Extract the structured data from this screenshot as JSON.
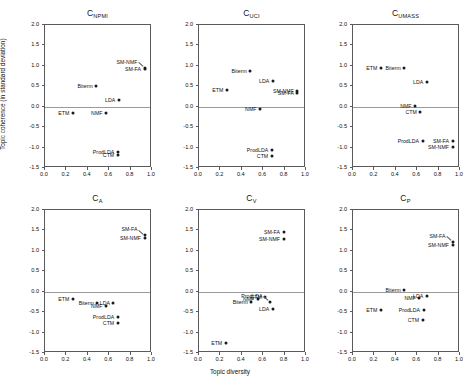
{
  "figure": {
    "ylabel": "Topic coherence (in standard deviation)",
    "xlabel": "Topic diversity",
    "xticks": [
      "0.0",
      "0.2",
      "0.4",
      "0.6",
      "0.8",
      "1.0"
    ],
    "yticks": [
      "2.0",
      "1.5",
      "1.0",
      "0.5",
      "0.0",
      "-0.5",
      "-1.0",
      "-1.5"
    ],
    "point_color": "#1a1a1a",
    "axis_color": "#5a5a5a"
  },
  "chart_data": [
    {
      "type": "scatter",
      "title": "C_NPMI",
      "title_base": "C",
      "title_sub": "NPMI",
      "xlabel": "",
      "ylabel": "Topic coherence (in standard deviation)",
      "xlim": [
        0.0,
        1.0
      ],
      "ylim": [
        -1.5,
        2.0
      ],
      "grid": false,
      "legend": "none",
      "points": [
        {
          "label": "SM-NMF",
          "x": 0.93,
          "y": 0.95,
          "label_pos": "leader-left"
        },
        {
          "label": "SM-FA",
          "x": 0.93,
          "y": 0.92,
          "label_pos": "left"
        },
        {
          "label": "Biterm",
          "x": 0.48,
          "y": 0.5,
          "label_pos": "left"
        },
        {
          "label": "LDA",
          "x": 0.69,
          "y": 0.17,
          "label_pos": "left"
        },
        {
          "label": "ETM",
          "x": 0.26,
          "y": -0.15,
          "label_pos": "left"
        },
        {
          "label": "NMF",
          "x": 0.57,
          "y": -0.15,
          "label_pos": "left"
        },
        {
          "label": "ProdLDA",
          "x": 0.68,
          "y": -1.1,
          "label_pos": "left"
        },
        {
          "label": "CTM",
          "x": 0.68,
          "y": -1.17,
          "label_pos": "left"
        }
      ]
    },
    {
      "type": "scatter",
      "title": "C_UCI",
      "title_base": "C",
      "title_sub": "UCI",
      "xlabel": "",
      "ylabel": "",
      "xlim": [
        0.0,
        1.0
      ],
      "ylim": [
        -1.5,
        2.0
      ],
      "grid": false,
      "legend": "none",
      "points": [
        {
          "label": "Biterm",
          "x": 0.48,
          "y": 0.88,
          "label_pos": "left"
        },
        {
          "label": "LDA",
          "x": 0.69,
          "y": 0.62,
          "label_pos": "left"
        },
        {
          "label": "ETM",
          "x": 0.26,
          "y": 0.42,
          "label_pos": "left"
        },
        {
          "label": "SM-NMF",
          "x": 0.92,
          "y": 0.38,
          "label_pos": "left"
        },
        {
          "label": "SM-FA",
          "x": 0.92,
          "y": 0.33,
          "label_pos": "left"
        },
        {
          "label": "NMF",
          "x": 0.57,
          "y": -0.05,
          "label_pos": "left"
        },
        {
          "label": "ProdLDA",
          "x": 0.68,
          "y": -1.05,
          "label_pos": "left"
        },
        {
          "label": "CTM",
          "x": 0.68,
          "y": -1.2,
          "label_pos": "left"
        }
      ]
    },
    {
      "type": "scatter",
      "title": "C_UMASS",
      "title_base": "C",
      "title_sub": "UMASS",
      "xlabel": "",
      "ylabel": "",
      "xlim": [
        0.0,
        1.0
      ],
      "ylim": [
        -1.5,
        2.0
      ],
      "grid": false,
      "legend": "none",
      "points": [
        {
          "label": "ETM",
          "x": 0.26,
          "y": 0.95,
          "label_pos": "left"
        },
        {
          "label": "Biterm",
          "x": 0.48,
          "y": 0.95,
          "label_pos": "left"
        },
        {
          "label": "LDA",
          "x": 0.69,
          "y": 0.6,
          "label_pos": "left"
        },
        {
          "label": "NMF",
          "x": 0.58,
          "y": 0.02,
          "label_pos": "left"
        },
        {
          "label": "CTM",
          "x": 0.63,
          "y": -0.13,
          "label_pos": "left"
        },
        {
          "label": "ProdLDA",
          "x": 0.65,
          "y": -0.85,
          "label_pos": "left"
        },
        {
          "label": "SM-FA",
          "x": 0.93,
          "y": -0.85,
          "label_pos": "left"
        },
        {
          "label": "SM-NMF",
          "x": 0.93,
          "y": -0.98,
          "label_pos": "left"
        }
      ]
    },
    {
      "type": "scatter",
      "title": "C_A",
      "title_base": "C",
      "title_sub": "A",
      "xlabel": "Topic diversity",
      "ylabel": "Topic coherence (in standard deviation)",
      "xlim": [
        0.0,
        1.0
      ],
      "ylim": [
        -1.5,
        2.0
      ],
      "grid": false,
      "legend": "none",
      "points": [
        {
          "label": "SM-FA",
          "x": 0.93,
          "y": 1.38,
          "label_pos": "leader-left"
        },
        {
          "label": "SM-NMF",
          "x": 0.93,
          "y": 1.32,
          "label_pos": "left"
        },
        {
          "label": "ETM",
          "x": 0.26,
          "y": -0.17,
          "label_pos": "left"
        },
        {
          "label": "Biterm",
          "x": 0.49,
          "y": -0.27,
          "label_pos": "left"
        },
        {
          "label": "LDA",
          "x": 0.64,
          "y": -0.28,
          "label_pos": "left"
        },
        {
          "label": "NMF",
          "x": 0.57,
          "y": -0.35,
          "label_pos": "left"
        },
        {
          "label": "ProdLDA",
          "x": 0.68,
          "y": -0.62,
          "label_pos": "left"
        },
        {
          "label": "CTM",
          "x": 0.68,
          "y": -0.77,
          "label_pos": "left"
        }
      ]
    },
    {
      "type": "scatter",
      "title": "C_V",
      "title_base": "C",
      "title_sub": "V",
      "xlabel": "Topic diversity",
      "ylabel": "",
      "xlim": [
        0.0,
        1.0
      ],
      "ylim": [
        -1.5,
        2.0
      ],
      "grid": false,
      "legend": "none",
      "points": [
        {
          "label": "SM-FA",
          "x": 0.79,
          "y": 1.45,
          "label_pos": "left"
        },
        {
          "label": "SM-NMF",
          "x": 0.79,
          "y": 1.3,
          "label_pos": "left"
        },
        {
          "label": "CTM",
          "x": 0.62,
          "y": -0.12,
          "label_pos": "left"
        },
        {
          "label": "NMF",
          "x": 0.55,
          "y": -0.18,
          "label_pos": "left"
        },
        {
          "label": "Biterm",
          "x": 0.49,
          "y": -0.25,
          "label_pos": "left"
        },
        {
          "label": "ProdLDA",
          "x": 0.66,
          "y": -0.25,
          "label_pos": "leader-left"
        },
        {
          "label": "LDA",
          "x": 0.69,
          "y": -0.42,
          "label_pos": "left"
        },
        {
          "label": "ETM",
          "x": 0.25,
          "y": -1.25,
          "label_pos": "left"
        }
      ]
    },
    {
      "type": "scatter",
      "title": "C_P",
      "title_base": "C",
      "title_sub": "P",
      "xlabel": "Topic diversity",
      "ylabel": "",
      "xlim": [
        0.0,
        1.0
      ],
      "ylim": [
        -1.5,
        2.0
      ],
      "grid": false,
      "legend": "none",
      "points": [
        {
          "label": "SM-FA",
          "x": 0.93,
          "y": 1.22,
          "label_pos": "leader-left"
        },
        {
          "label": "SM-NMF",
          "x": 0.93,
          "y": 1.15,
          "label_pos": "left"
        },
        {
          "label": "Biterm",
          "x": 0.48,
          "y": 0.05,
          "label_pos": "left"
        },
        {
          "label": "LDA",
          "x": 0.69,
          "y": -0.1,
          "label_pos": "left"
        },
        {
          "label": "NMF",
          "x": 0.62,
          "y": -0.15,
          "label_pos": "left"
        },
        {
          "label": "ETM",
          "x": 0.26,
          "y": -0.45,
          "label_pos": "left"
        },
        {
          "label": "ProdLDA",
          "x": 0.66,
          "y": -0.45,
          "label_pos": "left"
        },
        {
          "label": "CTM",
          "x": 0.65,
          "y": -0.7,
          "label_pos": "left"
        }
      ]
    }
  ]
}
